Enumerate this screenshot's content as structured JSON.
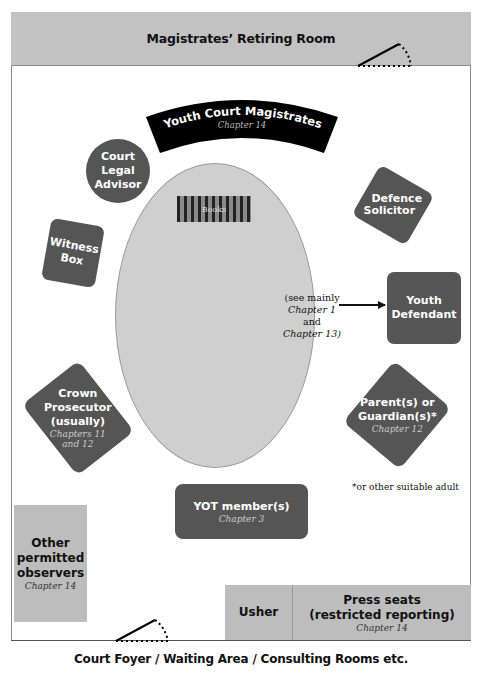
{
  "rooms": {
    "top": "Magistrates’ Retiring Room",
    "bottom": "Court Foyer / Waiting Area / Consulting Rooms etc."
  },
  "bench": {
    "label": "Youth Court Magistrates",
    "chapter": "Chapter 14"
  },
  "table": {
    "books_label": "Books"
  },
  "seats": {
    "legal_advisor": {
      "lines": [
        "Court",
        "Legal",
        "Advisor"
      ]
    },
    "witness_box": {
      "lines": [
        "Witness",
        "Box"
      ]
    },
    "defence": {
      "lines": [
        "Defence",
        "Solicitor"
      ]
    },
    "youth_defendant": {
      "lines": [
        "Youth",
        "Defendant"
      ]
    },
    "prosecutor": {
      "lines": [
        "Crown",
        "Prosecutor",
        "(usually)"
      ],
      "chapter_lines": [
        "Chapters 11",
        "and 12"
      ]
    },
    "parents": {
      "lines": [
        "Parent(s) or",
        "Guardian(s)*"
      ],
      "chapter": "Chapter 12"
    },
    "yot": {
      "label": "YOT member(s)",
      "chapter": "Chapter 3"
    },
    "observers": {
      "lines": [
        "Other",
        "permitted",
        "observers"
      ],
      "chapter": "Chapter 14"
    },
    "usher": {
      "label": "Usher"
    },
    "press": {
      "lines": [
        "Press seats",
        "(restricted reporting)"
      ],
      "chapter": "Chapter 14"
    }
  },
  "defendant_note": {
    "line1": "(see mainly",
    "line2a": "Chapter 1",
    "line2b": " and",
    "line3": "Chapter 13)"
  },
  "footnote": "*or other suitable adult",
  "colors": {
    "dark_seat": "#555555",
    "gray_area": "#bdbdbd",
    "table": "#cfcfcf",
    "bench": "#000000"
  }
}
